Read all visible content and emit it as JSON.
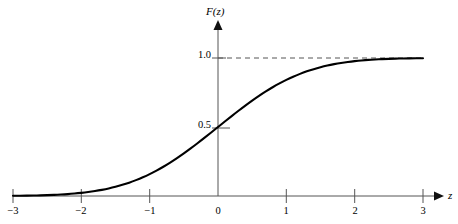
{
  "chart_data": {
    "type": "line",
    "title": "",
    "subtitle": "",
    "xlabel": "z",
    "ylabel": "F(z)",
    "xlim": [
      -3,
      3
    ],
    "ylim": [
      0,
      1.08
    ],
    "grid": false,
    "legend": null,
    "x_ticks": [
      {
        "value": -3,
        "label": "−3"
      },
      {
        "value": -2,
        "label": "−2"
      },
      {
        "value": -1,
        "label": "−1"
      },
      {
        "value": 0,
        "label": "0"
      },
      {
        "value": 1,
        "label": "1"
      },
      {
        "value": 2,
        "label": "2"
      },
      {
        "value": 3,
        "label": "3"
      }
    ],
    "y_ticks": [
      {
        "value": 0.5,
        "label": "0.5"
      },
      {
        "value": 1.0,
        "label": "1.0"
      }
    ],
    "annotations": [
      {
        "name": "asymptote",
        "type": "dashed-horizontal-line",
        "y": 1.0,
        "x_from": 0,
        "x_to": 3
      }
    ],
    "series": [
      {
        "name": "standard normal cumulative distribution function",
        "color": "#000000",
        "x": [
          -3.0,
          -2.9,
          -2.8,
          -2.7,
          -2.6,
          -2.5,
          -2.4,
          -2.3,
          -2.2,
          -2.1,
          -2.0,
          -1.9,
          -1.8,
          -1.7,
          -1.6,
          -1.5,
          -1.4,
          -1.3,
          -1.2,
          -1.1,
          -1.0,
          -0.9,
          -0.8,
          -0.7,
          -0.6,
          -0.5,
          -0.4,
          -0.3,
          -0.2,
          -0.1,
          0.0,
          0.1,
          0.2,
          0.3,
          0.4,
          0.5,
          0.6,
          0.7,
          0.8,
          0.9,
          1.0,
          1.1,
          1.2,
          1.3,
          1.4,
          1.5,
          1.6,
          1.7,
          1.8,
          1.9,
          2.0,
          2.1,
          2.2,
          2.3,
          2.4,
          2.5,
          2.6,
          2.7,
          2.8,
          2.9,
          3.0
        ],
        "values": [
          0.0013,
          0.0019,
          0.0026,
          0.0035,
          0.0047,
          0.0062,
          0.0082,
          0.0107,
          0.0139,
          0.0179,
          0.0228,
          0.0287,
          0.0359,
          0.0446,
          0.0548,
          0.0668,
          0.0808,
          0.0968,
          0.1151,
          0.1357,
          0.1587,
          0.1841,
          0.2119,
          0.242,
          0.2743,
          0.3085,
          0.3446,
          0.3821,
          0.4207,
          0.4602,
          0.5,
          0.5398,
          0.5793,
          0.6179,
          0.6554,
          0.6915,
          0.7257,
          0.758,
          0.7881,
          0.8159,
          0.8413,
          0.8643,
          0.8849,
          0.9032,
          0.9192,
          0.9332,
          0.9452,
          0.9554,
          0.9641,
          0.9713,
          0.9772,
          0.9821,
          0.9861,
          0.9893,
          0.9918,
          0.9938,
          0.9953,
          0.9965,
          0.9974,
          0.9981,
          0.9987
        ]
      }
    ]
  },
  "colors": {
    "curve": "#000000",
    "axis": "#555555",
    "dashed": "#555555",
    "text": "#000000",
    "background": "#ffffff"
  }
}
